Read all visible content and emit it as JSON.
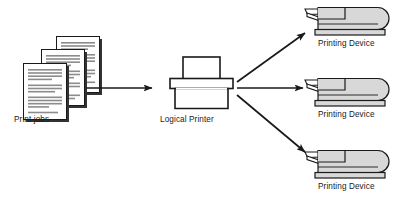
{
  "diagram": {
    "background_color": "#ffffff",
    "line_color": "#1a1a1a",
    "device_fill_color": "#d8d8d8",
    "document_fill_color": "#ffffff",
    "document_line_color": "#8c8c8c",
    "shadow_color": "#333333",
    "nodes": {
      "print_jobs": {
        "label": "Print jobs",
        "icon": "document-stack-icon",
        "count": 3
      },
      "logical_printer": {
        "label": "Logical Printer",
        "icon": "logical-printer-icon"
      },
      "printing_devices": [
        {
          "label": "Printing Device",
          "icon": "printing-device-icon"
        },
        {
          "label": "Printing Device",
          "icon": "printing-device-icon"
        },
        {
          "label": "Printing Device",
          "icon": "printing-device-icon"
        }
      ]
    },
    "arrows": [
      {
        "name": "jobs-to-printer",
        "direction": "right"
      },
      {
        "name": "printer-to-device-0",
        "direction": "up-right"
      },
      {
        "name": "printer-to-device-1",
        "direction": "right"
      },
      {
        "name": "printer-to-device-2",
        "direction": "down-right"
      }
    ]
  }
}
